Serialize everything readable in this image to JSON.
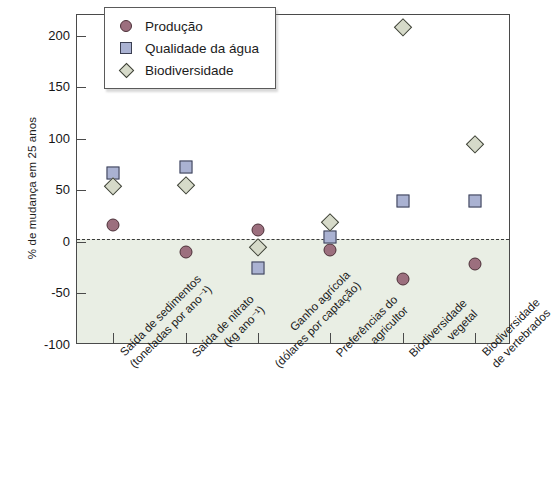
{
  "chart_data": {
    "type": "scatter",
    "title": "",
    "xlabel": "",
    "ylabel": "% de mudança em 25 anos",
    "ylim": [
      -100,
      220
    ],
    "yticks": [
      200,
      150,
      100,
      50,
      0,
      -50,
      -100
    ],
    "ytick_labels": [
      "200",
      "150",
      "100",
      "50",
      "0",
      "-50",
      "-100"
    ],
    "grid": false,
    "legend_position": "top-left",
    "zero_reference_line": true,
    "shaded_region_below_zero": true,
    "categories": [
      "Saída de sedimentos\n(toneladas por ano⁻¹)",
      "Saída de nitrato\n(kg ano⁻¹)",
      "Ganho agrícola\n(dólares por captação)",
      "Preferências do\nagricultor",
      "Biodiversidade\nvegetal",
      "Biodiversidade\nde vertebrados"
    ],
    "category_lines": [
      [
        "Saída de sedimentos",
        "(toneladas por ano⁻¹)"
      ],
      [
        "Saída de nitrato",
        "(kg ano⁻¹)"
      ],
      [
        "Ganho agrícola",
        "(dólares por captação)"
      ],
      [
        "Preferências do",
        "agricultor"
      ],
      [
        "Biodiversidade",
        "vegetal"
      ],
      [
        "Biodiversidade",
        "de vertebrados"
      ]
    ],
    "series": [
      {
        "name": "Produção",
        "marker": "circle",
        "color": "#9c6f7e",
        "edge_color": "#4c3038",
        "values": [
          16,
          -10,
          12,
          -8,
          -36,
          -21
        ]
      },
      {
        "name": "Qualidade da água",
        "marker": "square",
        "color": "#aab2d2",
        "edge_color": "#3b3f52",
        "values": [
          67,
          73,
          -25,
          5,
          40,
          40
        ]
      },
      {
        "name": "Biodiversidade",
        "marker": "diamond",
        "color": "#d6dac9",
        "edge_color": "#3c3f36",
        "values": [
          54,
          55,
          -5,
          19,
          208,
          95
        ]
      }
    ]
  },
  "legend": {
    "items": [
      {
        "label": "Produção",
        "marker": "circle-marker"
      },
      {
        "label": "Qualidade da água",
        "marker": "square-marker"
      },
      {
        "label": "Biodiversidade",
        "marker": "diamond-marker"
      }
    ]
  },
  "colors": {
    "producao": "#9c6f7e",
    "qualidade_agua": "#aab2d2",
    "biodiversidade": "#d6dac9",
    "axis": "#4a4a4a",
    "shaded_band": "#e9eee4",
    "background": "#ffffff"
  }
}
